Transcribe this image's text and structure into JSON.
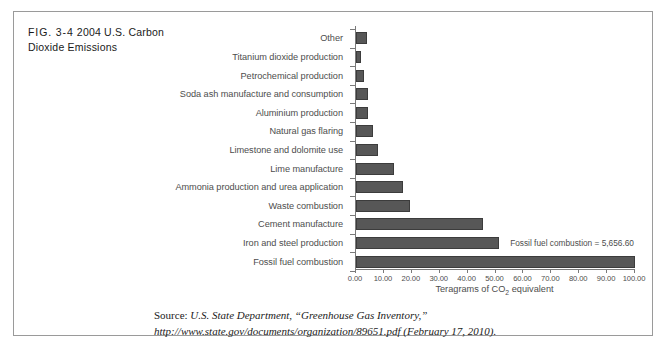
{
  "figure": {
    "number": "FIG. 3-4",
    "title": "2004 U.S. Carbon Dioxide Emissions"
  },
  "caption": {
    "lead": "Source:",
    "body": " U.S. State Department, “Greenhouse Gas Inventory,” http://www.state.gov/documents/organization/89651.pdf (February 17, 2010)."
  },
  "annotation": {
    "text": "Fossil fuel combustion = 5,656.60"
  },
  "colors": {
    "bar_fill": "#575757",
    "bar_border": "#3c3c3c",
    "axis": "#7a7a7a",
    "frame": "#9a9a9a",
    "label_text": "#4d4d4d"
  },
  "chart_data": {
    "type": "bar",
    "orientation": "horizontal",
    "title": "2004 U.S. Carbon Dioxide Emissions",
    "xlabel": "Teragrams of CO2 equivalent",
    "ylabel": "",
    "xlim": [
      0,
      100
    ],
    "grid": false,
    "legend": "none",
    "xticks": [
      "0.00",
      "10.00",
      "20.00",
      "30.00",
      "40.00",
      "50.00",
      "60.00",
      "70.00",
      "80.00",
      "90.00",
      "100.00"
    ],
    "xtick_values": [
      0,
      10,
      20,
      30,
      40,
      50,
      60,
      70,
      80,
      90,
      100
    ],
    "categories": [
      "Other",
      "Titanium dioxide production",
      "Petrochemical production",
      "Soda ash manufacture and consumption",
      "Aluminium production",
      "Natural gas flaring",
      "Limestone and dolomite use",
      "Lime manufacture",
      "Ammonia production and urea application",
      "Waste combustion",
      "Cement manufacture",
      "Iron and steel production",
      "Fossil fuel combustion"
    ],
    "values": [
      4.1,
      1.8,
      2.9,
      4.2,
      4.2,
      6.1,
      7.9,
      13.7,
      16.8,
      19.4,
      45.6,
      51.3,
      100.0
    ],
    "annotations": [
      {
        "category": "Fossil fuel combustion",
        "text": "Fossil fuel combustion = 5,656.60",
        "value": 5656.6
      }
    ]
  }
}
